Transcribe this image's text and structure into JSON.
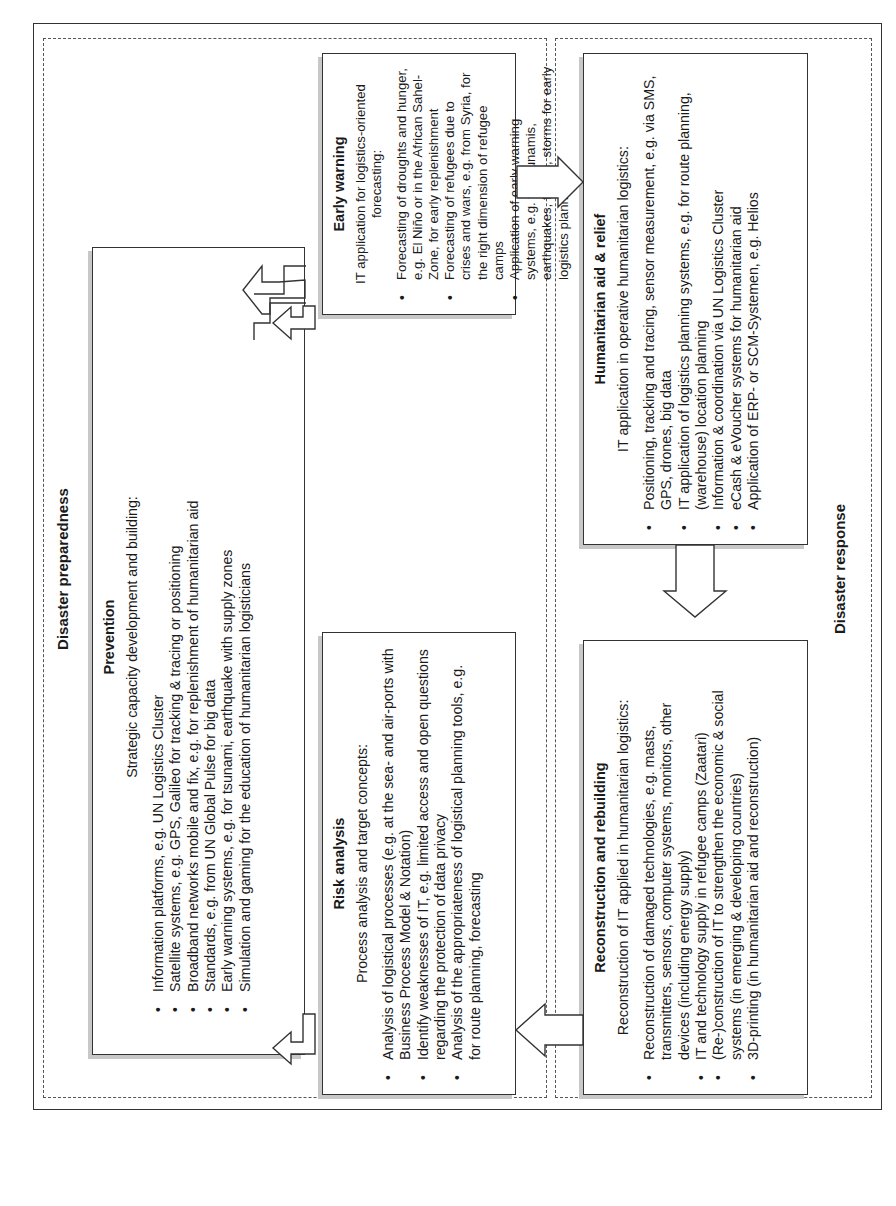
{
  "regions": {
    "preparedness": {
      "title": "Disaster preparedness"
    },
    "response": {
      "title": "Disaster response"
    }
  },
  "boxes": {
    "prevention": {
      "title": "Prevention",
      "intro": "Strategic capacity development and building:",
      "items": [
        "Information platforms, e.g. UN Logistics Cluster",
        "Satellite systems, e.g. GPS, Galileo for tracking & tracing or positioning",
        "Broadband networks mobile and fix, e.g. for replenishment of humanitarian aid",
        "Standards, e.g. from UN Global Pulse for big data",
        "Early warning systems, e.g. for tsunami, earthquake with supply zones",
        "Simulation and gaming for the education of humanitarian logisticians"
      ]
    },
    "early_warning": {
      "title": "Early warning",
      "intro": "IT application for logistics-oriented forecasting:",
      "items": [
        "Forecasting of droughts and hunger, e.g. El Niño or in the African Sahel-Zone, for early replenishment",
        "Forecasting of refugees due to crises and wars, e.g. from Syria, for the right dimension of refugee camps",
        "Application of early warning systems, e.g. for tsunamis, earthquakes, floods, storms for early logistics planning"
      ]
    },
    "risk_analysis": {
      "title": "Risk analysis",
      "intro": "Process analysis and target concepts:",
      "items": [
        "Analysis of logistical processes (e.g. at the sea- and air-ports with Business Process Model & Notation)",
        "Identify weaknesses of IT, e.g. limited access and open questions regarding the protection of data privacy",
        "Analysis of the appropriateness of logistical planning tools, e.g. for route planning, forecasting"
      ]
    },
    "humanitarian_aid": {
      "title": "Humanitarian aid & relief",
      "intro": "IT application in operative humanitarian logistics:",
      "items": [
        "Positioning, tracking and tracing, sensor measurement, e.g. via SMS, GPS, drones, big data",
        "IT application of logistics planning systems, e.g. for route planning, (warehouse) location planning",
        "Information & coordination via UN Logistics Cluster",
        "eCash & eVoucher systems for humanitarian aid",
        "Application of ERP- or SCM-Systemen, e.g. Helios"
      ]
    },
    "reconstruction": {
      "title": "Reconstruction and rebuilding",
      "intro": "Reconstruction of IT applied in humanitarian logistics:",
      "items": [
        "Reconstruction of damaged technologies, e.g. masts, transmitters, sensors, computer systems, monitors, other devices (including energy supply)",
        "IT and technology supply in refugee camps (Zaatari)",
        "(Re-)construction of IT to strengthen the economic & social systems (in emerging & developing countries)",
        "3D-printing (in humanitarian aid and reconstruction)"
      ]
    }
  },
  "arrows": [
    {
      "from": "prevention",
      "to": "early_warning",
      "shape": "elbow"
    },
    {
      "from": "early_warning",
      "to": "humanitarian_aid",
      "shape": "straight"
    },
    {
      "from": "humanitarian_aid",
      "to": "reconstruction",
      "shape": "straight"
    },
    {
      "from": "reconstruction",
      "to": "risk_analysis",
      "shape": "straight"
    },
    {
      "from": "risk_analysis",
      "to": "prevention",
      "shape": "elbow"
    }
  ]
}
